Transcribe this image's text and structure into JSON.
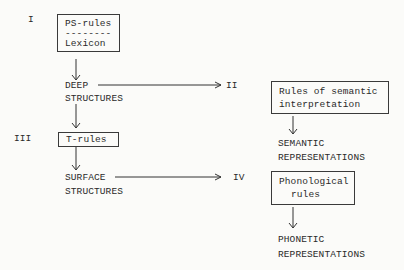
{
  "diagram": {
    "stages": [
      {
        "numeral": "I"
      },
      {
        "numeral": "II"
      },
      {
        "numeral": "III"
      },
      {
        "numeral": "IV"
      }
    ],
    "base_box": {
      "line1": "PS-rules",
      "separator": "--------",
      "line2": "Lexicon"
    },
    "deep_structures": {
      "line1": "DEEP",
      "line2": "STRUCTURES"
    },
    "semantic_box": {
      "line1": "Rules of semantic",
      "line2": "interpretation"
    },
    "semantic_output": {
      "line1": "SEMANTIC",
      "line2": "REPRESENTATIONS"
    },
    "transform_box": {
      "line1": "T-rules"
    },
    "surface_structures": {
      "line1": "SURFACE",
      "line2": "STRUCTURES"
    },
    "phonological_box": {
      "line1": "Phonological",
      "line2": "rules"
    },
    "phonetic_output": {
      "line1": "PHONETIC",
      "line2": "REPRESENTATIONS"
    }
  }
}
